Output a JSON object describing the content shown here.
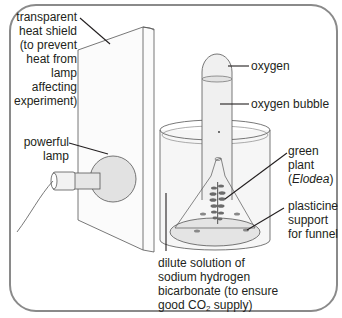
{
  "diagram": {
    "colors": {
      "frame": "#8a8a8a",
      "line": "#555555",
      "leader": "#231f20",
      "fill_light": "#ececec",
      "fill_glass": "#f4f4f4",
      "bulb": "#e2e2e2",
      "plant": "#6b6b6b"
    },
    "labels": {
      "heat_shield": [
        "transparent",
        "heat shield",
        "(to prevent",
        "heat from",
        "lamp",
        "affecting",
        "experiment)"
      ],
      "lamp": [
        "powerful",
        "lamp"
      ],
      "oxygen": "oxygen",
      "oxygen_bubble": "oxygen bubble",
      "plant": {
        "line1": "green",
        "line2": "plant",
        "line3_open": "(",
        "line3_italic": "Elodea",
        "line3_close": ")"
      },
      "support": [
        "plasticine",
        "support",
        "for funnel"
      ],
      "solution": {
        "line1": "dilute solution of",
        "line2": "sodium hydrogen",
        "line3": "bicarbonate (to ensure",
        "line4_pre": "good CO",
        "line4_sub": "2",
        "line4_post": " supply)"
      }
    }
  }
}
